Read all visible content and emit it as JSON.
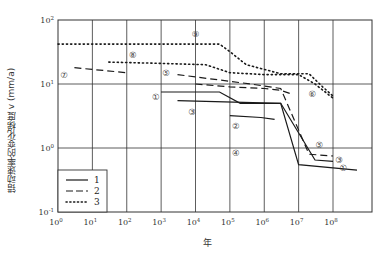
{
  "chart_data": {
    "type": "line",
    "title": "",
    "xlabel": "年",
    "ylabel": "错动速率的变化梯度 v (mm/a)",
    "xscale": "log",
    "yscale": "log",
    "xlim": [
      1,
      1000000000.0
    ],
    "ylim": [
      0.1,
      100
    ],
    "x_ticks": [
      {
        "base": "10",
        "exp": "0",
        "value": 1
      },
      {
        "base": "10",
        "exp": "1",
        "value": 10
      },
      {
        "base": "10",
        "exp": "2",
        "value": 100
      },
      {
        "base": "10",
        "exp": "3",
        "value": 1000
      },
      {
        "base": "10",
        "exp": "4",
        "value": 10000
      },
      {
        "base": "10",
        "exp": "5",
        "value": 100000
      },
      {
        "base": "10",
        "exp": "6",
        "value": 1000000
      },
      {
        "base": "10",
        "exp": "7",
        "value": 10000000
      },
      {
        "base": "10",
        "exp": "8",
        "value": 100000000
      }
    ],
    "y_ticks": [
      {
        "base": "10",
        "exp": "2",
        "value": 100
      },
      {
        "base": "10",
        "exp": "1",
        "value": 10
      },
      {
        "base": "10",
        "exp": "0",
        "value": 1
      },
      {
        "base": "10",
        "exp": "-1",
        "value": 0.1
      }
    ],
    "grid": true,
    "legend_position": "lower left",
    "legend": [
      {
        "key": "1",
        "style": "solid"
      },
      {
        "key": "2",
        "style": "dashed"
      },
      {
        "key": "3",
        "style": "dotted"
      }
    ],
    "series": [
      {
        "name": "①",
        "style": "solid",
        "points": [
          [
            1000,
            7.5
          ],
          [
            50000,
            7.5
          ],
          [
            200000,
            5.0
          ],
          [
            3000000,
            5.0
          ],
          [
            10000000,
            0.55
          ],
          [
            500000000,
            0.45
          ]
        ],
        "label_at": [
          700,
          6.2
        ]
      },
      {
        "name": "③",
        "style": "solid",
        "points": [
          [
            3000,
            5.5
          ],
          [
            3000000,
            5.0
          ],
          [
            30000000,
            0.65
          ],
          [
            100000000,
            0.62
          ]
        ],
        "label_at": [
          8000,
          3.6
        ]
      },
      {
        "name": "②",
        "style": "solid",
        "points": [
          [
            100000,
            3.2
          ],
          [
            800000,
            3.0
          ],
          [
            2000000,
            2.8
          ]
        ],
        "label_at": [
          150000,
          2.2
        ]
      },
      {
        "name": "⑤",
        "style": "dashed",
        "points": [
          [
            3000,
            14
          ],
          [
            400000,
            10
          ],
          [
            3000000,
            8.5
          ],
          [
            20000000,
            0.8
          ],
          [
            100000000,
            0.75
          ]
        ],
        "label_at": [
          1400,
          15
        ]
      },
      {
        "name": "⑥",
        "style": "dashed",
        "points": [
          [
            10000,
            10
          ],
          [
            100000,
            9.0
          ],
          [
            1000000,
            8.5
          ],
          [
            3000000,
            8.0
          ],
          [
            6000000,
            7.0
          ]
        ],
        "label_at": [
          25000000,
          7.0
        ]
      },
      {
        "name": "⑦",
        "style": "dashed",
        "points": [
          [
            3,
            18
          ],
          [
            100,
            15
          ]
        ],
        "label_at": [
          1.5,
          14
        ]
      },
      {
        "name": "⑧",
        "style": "dotted",
        "points": [
          [
            30,
            22
          ],
          [
            1000,
            21
          ],
          [
            20000,
            20
          ],
          [
            100000,
            15
          ],
          [
            1000000,
            14
          ],
          [
            10000000,
            14
          ],
          [
            30000000,
            10
          ],
          [
            100000000,
            6.0
          ]
        ],
        "label_at": [
          150,
          28
        ]
      },
      {
        "name": "⑨",
        "style": "dotted",
        "points": [
          [
            1,
            42
          ],
          [
            50000,
            42
          ],
          [
            100000,
            32
          ],
          [
            300000,
            20
          ],
          [
            3000000,
            14.5
          ],
          [
            20000000,
            14.5
          ],
          [
            50000000,
            9
          ],
          [
            100000000,
            6.5
          ]
        ],
        "label_at": [
          10000,
          60
        ]
      },
      {
        "name": "④",
        "style": "none",
        "points": [],
        "label_at": [
          150000,
          0.85
        ]
      },
      {
        "name": "⑤",
        "style": "none",
        "points": [],
        "label_at": [
          40000000,
          1.1
        ]
      },
      {
        "name": "③",
        "style": "none",
        "points": [],
        "label_at": [
          150000000,
          0.65
        ]
      },
      {
        "name": "①",
        "style": "none",
        "points": [],
        "label_at": [
          200000000,
          0.48
        ]
      }
    ]
  },
  "colors": {
    "line": "#1a1a1a",
    "grid": "#333333",
    "background": "#ffffff"
  }
}
